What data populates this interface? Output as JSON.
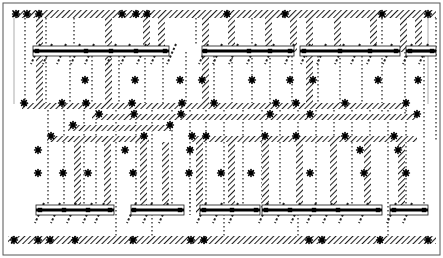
{
  "diagram": {
    "type": "structural-framing-elevation",
    "width": 443,
    "height": 258,
    "background_color": "#ffffff",
    "ink_color": "#1a1a1a",
    "hatch_color": "#2b2b2b",
    "dot_color": "#3a3a3a"
  },
  "frame": {
    "name": "outer-border",
    "x": 3,
    "y": 3,
    "width": 437,
    "height": 252,
    "stroke": "#555555",
    "stroke_width": 1
  },
  "hatch_bands_horizontal": [
    {
      "name": "top-wall-band",
      "x": 12,
      "y": 10,
      "width": 424,
      "height": 8
    },
    {
      "name": "mid-band-upper",
      "x": 22,
      "y": 103,
      "width": 385,
      "height": 6
    },
    {
      "name": "mid-band-second",
      "x": 92,
      "y": 114,
      "width": 325,
      "height": 6
    },
    {
      "name": "mid-band-third",
      "x": 68,
      "y": 125,
      "width": 103,
      "height": 6
    },
    {
      "name": "mid-band-fourth",
      "x": 47,
      "y": 136,
      "width": 102,
      "height": 6
    },
    {
      "name": "mid-band-fifth",
      "x": 190,
      "y": 136,
      "width": 227,
      "height": 6
    },
    {
      "name": "bottom-wall-band",
      "x": 8,
      "y": 236,
      "width": 428,
      "height": 8
    }
  ],
  "hatch_columns_vertical": [
    {
      "name": "col-a",
      "x": 36,
      "y": 18,
      "width": 7,
      "height": 88
    },
    {
      "name": "col-b",
      "x": 105,
      "y": 18,
      "width": 7,
      "height": 90
    },
    {
      "name": "col-c",
      "x": 143,
      "y": 18,
      "width": 7,
      "height": 34
    },
    {
      "name": "col-d",
      "x": 158,
      "y": 18,
      "width": 7,
      "height": 34
    },
    {
      "name": "col-e",
      "x": 202,
      "y": 18,
      "width": 7,
      "height": 90
    },
    {
      "name": "col-f",
      "x": 228,
      "y": 18,
      "width": 7,
      "height": 34
    },
    {
      "name": "col-g",
      "x": 265,
      "y": 18,
      "width": 7,
      "height": 34
    },
    {
      "name": "col-h",
      "x": 290,
      "y": 18,
      "width": 7,
      "height": 34
    },
    {
      "name": "col-i",
      "x": 306,
      "y": 18,
      "width": 7,
      "height": 90
    },
    {
      "name": "col-j",
      "x": 334,
      "y": 18,
      "width": 7,
      "height": 34
    },
    {
      "name": "col-k",
      "x": 370,
      "y": 18,
      "width": 7,
      "height": 34
    },
    {
      "name": "col-l",
      "x": 400,
      "y": 18,
      "width": 7,
      "height": 34
    },
    {
      "name": "col-m",
      "x": 415,
      "y": 18,
      "width": 7,
      "height": 34
    },
    {
      "name": "col-n",
      "x": 74,
      "y": 142,
      "width": 7,
      "height": 72
    },
    {
      "name": "col-o",
      "x": 104,
      "y": 142,
      "width": 7,
      "height": 72
    },
    {
      "name": "col-p",
      "x": 140,
      "y": 142,
      "width": 7,
      "height": 72
    },
    {
      "name": "col-q",
      "x": 162,
      "y": 142,
      "width": 7,
      "height": 72
    },
    {
      "name": "col-r",
      "x": 196,
      "y": 142,
      "width": 7,
      "height": 72
    },
    {
      "name": "col-s",
      "x": 228,
      "y": 142,
      "width": 7,
      "height": 72
    },
    {
      "name": "col-t",
      "x": 262,
      "y": 142,
      "width": 7,
      "height": 72
    },
    {
      "name": "col-u",
      "x": 296,
      "y": 142,
      "width": 7,
      "height": 72
    },
    {
      "name": "col-v",
      "x": 330,
      "y": 142,
      "width": 7,
      "height": 72
    },
    {
      "name": "col-w",
      "x": 364,
      "y": 142,
      "width": 7,
      "height": 72
    },
    {
      "name": "col-x",
      "x": 398,
      "y": 142,
      "width": 7,
      "height": 72
    }
  ],
  "beams_upper_row": [
    {
      "name": "beam-u1",
      "x": 33,
      "y": 46,
      "width": 136,
      "height": 10
    },
    {
      "name": "beam-u2",
      "x": 202,
      "y": 46,
      "width": 92,
      "height": 10
    },
    {
      "name": "beam-u3",
      "x": 300,
      "y": 46,
      "width": 100,
      "height": 10
    },
    {
      "name": "beam-u4",
      "x": 406,
      "y": 46,
      "width": 30,
      "height": 10
    }
  ],
  "beams_lower_row": [
    {
      "name": "beam-l1",
      "x": 36,
      "y": 205,
      "width": 78,
      "height": 10
    },
    {
      "name": "beam-l2",
      "x": 131,
      "y": 205,
      "width": 53,
      "height": 10
    },
    {
      "name": "beam-l3",
      "x": 200,
      "y": 205,
      "width": 60,
      "height": 10
    },
    {
      "name": "beam-l4",
      "x": 262,
      "y": 205,
      "width": 120,
      "height": 10
    },
    {
      "name": "beam-l5",
      "x": 390,
      "y": 205,
      "width": 38,
      "height": 10
    }
  ],
  "dotted_verticals": [
    {
      "name": "dot-v-01",
      "x": 25,
      "y1": 18,
      "y2": 104
    },
    {
      "name": "dot-v-02",
      "x": 46,
      "y1": 18,
      "y2": 104
    },
    {
      "name": "dot-v-03",
      "x": 70,
      "y1": 52,
      "y2": 104
    },
    {
      "name": "dot-v-04",
      "x": 92,
      "y1": 52,
      "y2": 104
    },
    {
      "name": "dot-v-05",
      "x": 119,
      "y1": 52,
      "y2": 104
    },
    {
      "name": "dot-v-06",
      "x": 145,
      "y1": 18,
      "y2": 104
    },
    {
      "name": "dot-v-07",
      "x": 163,
      "y1": 18,
      "y2": 104
    },
    {
      "name": "dot-v-08",
      "x": 186,
      "y1": 52,
      "y2": 104
    },
    {
      "name": "dot-v-09",
      "x": 214,
      "y1": 52,
      "y2": 104
    },
    {
      "name": "dot-v-10",
      "x": 232,
      "y1": 18,
      "y2": 104
    },
    {
      "name": "dot-v-11",
      "x": 252,
      "y1": 18,
      "y2": 104
    },
    {
      "name": "dot-v-12",
      "x": 270,
      "y1": 18,
      "y2": 104
    },
    {
      "name": "dot-v-13",
      "x": 292,
      "y1": 52,
      "y2": 104
    },
    {
      "name": "dot-v-14",
      "x": 318,
      "y1": 52,
      "y2": 104
    },
    {
      "name": "dot-v-15",
      "x": 340,
      "y1": 18,
      "y2": 104
    },
    {
      "name": "dot-v-16",
      "x": 362,
      "y1": 52,
      "y2": 104
    },
    {
      "name": "dot-v-17",
      "x": 382,
      "y1": 18,
      "y2": 120
    },
    {
      "name": "dot-v-18",
      "x": 405,
      "y1": 52,
      "y2": 120
    },
    {
      "name": "dot-v-19",
      "x": 424,
      "y1": 52,
      "y2": 140
    },
    {
      "name": "dot-v-20",
      "x": 436,
      "y1": 18,
      "y2": 140
    },
    {
      "name": "dot-v-21",
      "x": 48,
      "y1": 110,
      "y2": 208
    },
    {
      "name": "dot-v-22",
      "x": 64,
      "y1": 110,
      "y2": 208
    },
    {
      "name": "dot-v-23",
      "x": 84,
      "y1": 110,
      "y2": 208
    },
    {
      "name": "dot-v-24",
      "x": 96,
      "y1": 110,
      "y2": 208
    },
    {
      "name": "dot-v-25",
      "x": 116,
      "y1": 110,
      "y2": 240
    },
    {
      "name": "dot-v-26",
      "x": 136,
      "y1": 110,
      "y2": 208
    },
    {
      "name": "dot-v-27",
      "x": 152,
      "y1": 110,
      "y2": 240
    },
    {
      "name": "dot-v-28",
      "x": 172,
      "y1": 110,
      "y2": 208
    },
    {
      "name": "dot-v-29",
      "x": 190,
      "y1": 110,
      "y2": 208
    },
    {
      "name": "dot-v-30",
      "x": 206,
      "y1": 110,
      "y2": 208
    },
    {
      "name": "dot-v-31",
      "x": 224,
      "y1": 110,
      "y2": 240
    },
    {
      "name": "dot-v-32",
      "x": 243,
      "y1": 110,
      "y2": 208
    },
    {
      "name": "dot-v-33",
      "x": 262,
      "y1": 110,
      "y2": 208
    },
    {
      "name": "dot-v-34",
      "x": 280,
      "y1": 110,
      "y2": 208
    },
    {
      "name": "dot-v-35",
      "x": 298,
      "y1": 110,
      "y2": 240
    },
    {
      "name": "dot-v-36",
      "x": 316,
      "y1": 110,
      "y2": 208
    },
    {
      "name": "dot-v-37",
      "x": 334,
      "y1": 110,
      "y2": 208
    },
    {
      "name": "dot-v-38",
      "x": 352,
      "y1": 110,
      "y2": 208
    },
    {
      "name": "dot-v-39",
      "x": 370,
      "y1": 110,
      "y2": 208
    },
    {
      "name": "dot-v-40",
      "x": 388,
      "y1": 110,
      "y2": 240
    },
    {
      "name": "dot-v-41",
      "x": 406,
      "y1": 110,
      "y2": 208
    },
    {
      "name": "dot-v-42",
      "x": 424,
      "y1": 142,
      "y2": 208
    },
    {
      "name": "dot-v-43",
      "x": 190,
      "y1": 190,
      "y2": 215
    },
    {
      "name": "dot-v-44",
      "x": 74,
      "y1": 18,
      "y2": 46
    },
    {
      "name": "dot-v-45",
      "x": 196,
      "y1": 18,
      "y2": 46
    }
  ],
  "nodes_star": [
    {
      "name": "node",
      "x": 16,
      "y": 14
    },
    {
      "name": "node",
      "x": 27,
      "y": 14
    },
    {
      "name": "node",
      "x": 39,
      "y": 14
    },
    {
      "name": "node",
      "x": 122,
      "y": 14
    },
    {
      "name": "node",
      "x": 136,
      "y": 14
    },
    {
      "name": "node",
      "x": 147,
      "y": 14
    },
    {
      "name": "node",
      "x": 227,
      "y": 14
    },
    {
      "name": "node",
      "x": 285,
      "y": 14
    },
    {
      "name": "node",
      "x": 382,
      "y": 14
    },
    {
      "name": "node",
      "x": 428,
      "y": 14
    },
    {
      "name": "node",
      "x": 24,
      "y": 103
    },
    {
      "name": "node",
      "x": 62,
      "y": 103
    },
    {
      "name": "node",
      "x": 86,
      "y": 103
    },
    {
      "name": "node",
      "x": 132,
      "y": 103
    },
    {
      "name": "node",
      "x": 182,
      "y": 103
    },
    {
      "name": "node",
      "x": 214,
      "y": 103
    },
    {
      "name": "node",
      "x": 276,
      "y": 103
    },
    {
      "name": "node",
      "x": 296,
      "y": 103
    },
    {
      "name": "node",
      "x": 345,
      "y": 103
    },
    {
      "name": "node",
      "x": 406,
      "y": 103
    },
    {
      "name": "node",
      "x": 99,
      "y": 114
    },
    {
      "name": "node",
      "x": 134,
      "y": 114
    },
    {
      "name": "node",
      "x": 181,
      "y": 114
    },
    {
      "name": "node",
      "x": 270,
      "y": 114
    },
    {
      "name": "node",
      "x": 310,
      "y": 114
    },
    {
      "name": "node",
      "x": 417,
      "y": 114
    },
    {
      "name": "node",
      "x": 73,
      "y": 125
    },
    {
      "name": "node",
      "x": 170,
      "y": 125
    },
    {
      "name": "node",
      "x": 51,
      "y": 136
    },
    {
      "name": "node",
      "x": 144,
      "y": 136
    },
    {
      "name": "node",
      "x": 192,
      "y": 136
    },
    {
      "name": "node",
      "x": 206,
      "y": 136
    },
    {
      "name": "node",
      "x": 265,
      "y": 136
    },
    {
      "name": "node",
      "x": 296,
      "y": 136
    },
    {
      "name": "node",
      "x": 345,
      "y": 136
    },
    {
      "name": "node",
      "x": 394,
      "y": 136
    },
    {
      "name": "node",
      "x": 14,
      "y": 240
    },
    {
      "name": "node",
      "x": 38,
      "y": 240
    },
    {
      "name": "node",
      "x": 50,
      "y": 240
    },
    {
      "name": "node",
      "x": 75,
      "y": 240
    },
    {
      "name": "node",
      "x": 133,
      "y": 240
    },
    {
      "name": "node",
      "x": 191,
      "y": 240
    },
    {
      "name": "node",
      "x": 204,
      "y": 240
    },
    {
      "name": "node",
      "x": 309,
      "y": 240
    },
    {
      "name": "node",
      "x": 322,
      "y": 240
    },
    {
      "name": "node",
      "x": 380,
      "y": 240
    },
    {
      "name": "node",
      "x": 428,
      "y": 240
    },
    {
      "name": "node",
      "x": 85,
      "y": 80
    },
    {
      "name": "node",
      "x": 135,
      "y": 80
    },
    {
      "name": "node",
      "x": 180,
      "y": 80
    },
    {
      "name": "node",
      "x": 202,
      "y": 80
    },
    {
      "name": "node",
      "x": 252,
      "y": 80
    },
    {
      "name": "node",
      "x": 290,
      "y": 80
    },
    {
      "name": "node",
      "x": 313,
      "y": 80
    },
    {
      "name": "node",
      "x": 378,
      "y": 80
    },
    {
      "name": "node",
      "x": 418,
      "y": 80
    },
    {
      "name": "node",
      "x": 38,
      "y": 173
    },
    {
      "name": "node",
      "x": 63,
      "y": 173
    },
    {
      "name": "node",
      "x": 88,
      "y": 173
    },
    {
      "name": "node",
      "x": 133,
      "y": 173
    },
    {
      "name": "node",
      "x": 189,
      "y": 173
    },
    {
      "name": "node",
      "x": 221,
      "y": 173
    },
    {
      "name": "node",
      "x": 251,
      "y": 173
    },
    {
      "name": "node",
      "x": 310,
      "y": 173
    },
    {
      "name": "node",
      "x": 364,
      "y": 173
    },
    {
      "name": "node",
      "x": 406,
      "y": 173
    },
    {
      "name": "node",
      "x": 38,
      "y": 150
    },
    {
      "name": "node",
      "x": 125,
      "y": 150
    },
    {
      "name": "node",
      "x": 190,
      "y": 150
    },
    {
      "name": "node",
      "x": 360,
      "y": 150
    },
    {
      "name": "node",
      "x": 398,
      "y": 150
    }
  ],
  "beam_nodes": [
    {
      "name": "beam-node",
      "x": 37,
      "y": 51
    },
    {
      "name": "beam-node",
      "x": 86,
      "y": 51
    },
    {
      "name": "beam-node",
      "x": 111,
      "y": 51
    },
    {
      "name": "beam-node",
      "x": 136,
      "y": 51
    },
    {
      "name": "beam-node",
      "x": 165,
      "y": 51
    },
    {
      "name": "beam-node",
      "x": 205,
      "y": 51
    },
    {
      "name": "beam-node",
      "x": 249,
      "y": 51
    },
    {
      "name": "beam-node",
      "x": 270,
      "y": 51
    },
    {
      "name": "beam-node",
      "x": 290,
      "y": 51
    },
    {
      "name": "beam-node",
      "x": 304,
      "y": 51
    },
    {
      "name": "beam-node",
      "x": 340,
      "y": 51
    },
    {
      "name": "beam-node",
      "x": 370,
      "y": 51
    },
    {
      "name": "beam-node",
      "x": 396,
      "y": 51
    },
    {
      "name": "beam-node",
      "x": 410,
      "y": 51
    },
    {
      "name": "beam-node",
      "x": 432,
      "y": 51
    },
    {
      "name": "beam-node",
      "x": 40,
      "y": 210
    },
    {
      "name": "beam-node",
      "x": 64,
      "y": 210
    },
    {
      "name": "beam-node",
      "x": 88,
      "y": 210
    },
    {
      "name": "beam-node",
      "x": 110,
      "y": 210
    },
    {
      "name": "beam-node",
      "x": 134,
      "y": 210
    },
    {
      "name": "beam-node",
      "x": 180,
      "y": 210
    },
    {
      "name": "beam-node",
      "x": 204,
      "y": 210
    },
    {
      "name": "beam-node",
      "x": 232,
      "y": 210
    },
    {
      "name": "beam-node",
      "x": 256,
      "y": 210
    },
    {
      "name": "beam-node",
      "x": 266,
      "y": 210
    },
    {
      "name": "beam-node",
      "x": 290,
      "y": 210
    },
    {
      "name": "beam-node",
      "x": 314,
      "y": 210
    },
    {
      "name": "beam-node",
      "x": 338,
      "y": 210
    },
    {
      "name": "beam-node",
      "x": 378,
      "y": 210
    },
    {
      "name": "beam-node",
      "x": 394,
      "y": 210
    },
    {
      "name": "beam-node",
      "x": 424,
      "y": 210
    }
  ],
  "diagonal_braces": [
    {
      "name": "brace",
      "x": 40,
      "y": 44
    },
    {
      "name": "brace",
      "x": 52,
      "y": 44
    },
    {
      "name": "brace",
      "x": 66,
      "y": 44
    },
    {
      "name": "brace",
      "x": 80,
      "y": 44
    },
    {
      "name": "brace",
      "x": 94,
      "y": 44
    },
    {
      "name": "brace",
      "x": 116,
      "y": 44
    },
    {
      "name": "brace",
      "x": 130,
      "y": 44
    },
    {
      "name": "brace",
      "x": 146,
      "y": 44
    },
    {
      "name": "brace",
      "x": 160,
      "y": 44
    },
    {
      "name": "brace",
      "x": 176,
      "y": 44
    },
    {
      "name": "brace",
      "x": 208,
      "y": 44
    },
    {
      "name": "brace",
      "x": 222,
      "y": 44
    },
    {
      "name": "brace",
      "x": 238,
      "y": 44
    },
    {
      "name": "brace",
      "x": 256,
      "y": 44
    },
    {
      "name": "brace",
      "x": 274,
      "y": 44
    },
    {
      "name": "brace",
      "x": 294,
      "y": 44
    },
    {
      "name": "brace",
      "x": 310,
      "y": 44
    },
    {
      "name": "brace",
      "x": 326,
      "y": 44
    },
    {
      "name": "brace",
      "x": 344,
      "y": 44
    },
    {
      "name": "brace",
      "x": 360,
      "y": 44
    },
    {
      "name": "brace",
      "x": 376,
      "y": 44
    },
    {
      "name": "brace",
      "x": 392,
      "y": 44
    },
    {
      "name": "brace",
      "x": 412,
      "y": 44
    },
    {
      "name": "brace",
      "x": 428,
      "y": 44
    },
    {
      "name": "brace",
      "x": 44,
      "y": 203
    },
    {
      "name": "brace",
      "x": 60,
      "y": 203
    },
    {
      "name": "brace",
      "x": 76,
      "y": 203
    },
    {
      "name": "brace",
      "x": 92,
      "y": 203
    },
    {
      "name": "brace",
      "x": 104,
      "y": 203
    },
    {
      "name": "brace",
      "x": 136,
      "y": 203
    },
    {
      "name": "brace",
      "x": 152,
      "y": 203
    },
    {
      "name": "brace",
      "x": 168,
      "y": 203
    },
    {
      "name": "brace",
      "x": 206,
      "y": 203
    },
    {
      "name": "brace",
      "x": 222,
      "y": 203
    },
    {
      "name": "brace",
      "x": 238,
      "y": 203
    },
    {
      "name": "brace",
      "x": 268,
      "y": 203
    },
    {
      "name": "brace",
      "x": 284,
      "y": 203
    },
    {
      "name": "brace",
      "x": 300,
      "y": 203
    },
    {
      "name": "brace",
      "x": 316,
      "y": 203
    },
    {
      "name": "brace",
      "x": 332,
      "y": 203
    },
    {
      "name": "brace",
      "x": 348,
      "y": 203
    },
    {
      "name": "brace",
      "x": 368,
      "y": 203
    },
    {
      "name": "brace",
      "x": 396,
      "y": 203
    },
    {
      "name": "brace",
      "x": 412,
      "y": 203
    }
  ],
  "thin_rules": [
    {
      "name": "thin-rule",
      "x1": 22,
      "y1": 108,
      "x2": 407,
      "y2": 108
    },
    {
      "name": "thin-rule",
      "x1": 92,
      "y1": 119,
      "x2": 417,
      "y2": 119
    },
    {
      "name": "thin-rule",
      "x1": 14,
      "y1": 18,
      "x2": 14,
      "y2": 104
    },
    {
      "name": "thin-rule",
      "x1": 428,
      "y1": 18,
      "x2": 428,
      "y2": 104
    }
  ]
}
